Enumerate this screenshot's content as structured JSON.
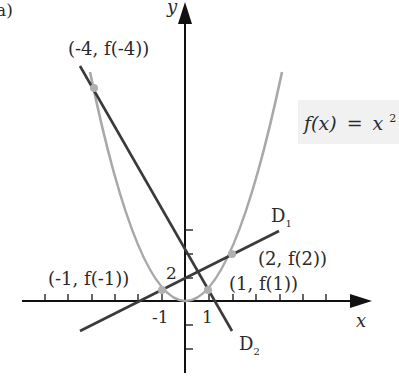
{
  "figure": {
    "panel_label": "a)",
    "formula": "f(x) = x²",
    "formula_parts": {
      "fx": "f(x)",
      "eq": "=",
      "x": "x",
      "exp": "2"
    },
    "axes": {
      "x_label": "x",
      "y_label": "y"
    },
    "tick_labels": {
      "x_neg1": "-1",
      "x_pos1": "1",
      "y_2": "2"
    },
    "points": [
      {
        "label": "(-4, f(-4))",
        "x": -4
      },
      {
        "label": "(-1, f(-1))",
        "x": -1
      },
      {
        "label": "(1, f(1))",
        "x": 1
      },
      {
        "label": "(2, f(2))",
        "x": 2
      }
    ],
    "lines": [
      {
        "label": "D",
        "sub": "1",
        "through": [
          "(-1, f(-1))",
          "(2, f(2))"
        ]
      },
      {
        "label": "D",
        "sub": "2",
        "through": [
          "(-4, f(-4))",
          "(1, f(1))"
        ]
      }
    ],
    "colors": {
      "axis": "#111111",
      "parabola": "#a8a8a8",
      "secant": "#3a3a3a",
      "point": "#b0b0b0",
      "formula_bg": "#f1f1f1"
    }
  }
}
